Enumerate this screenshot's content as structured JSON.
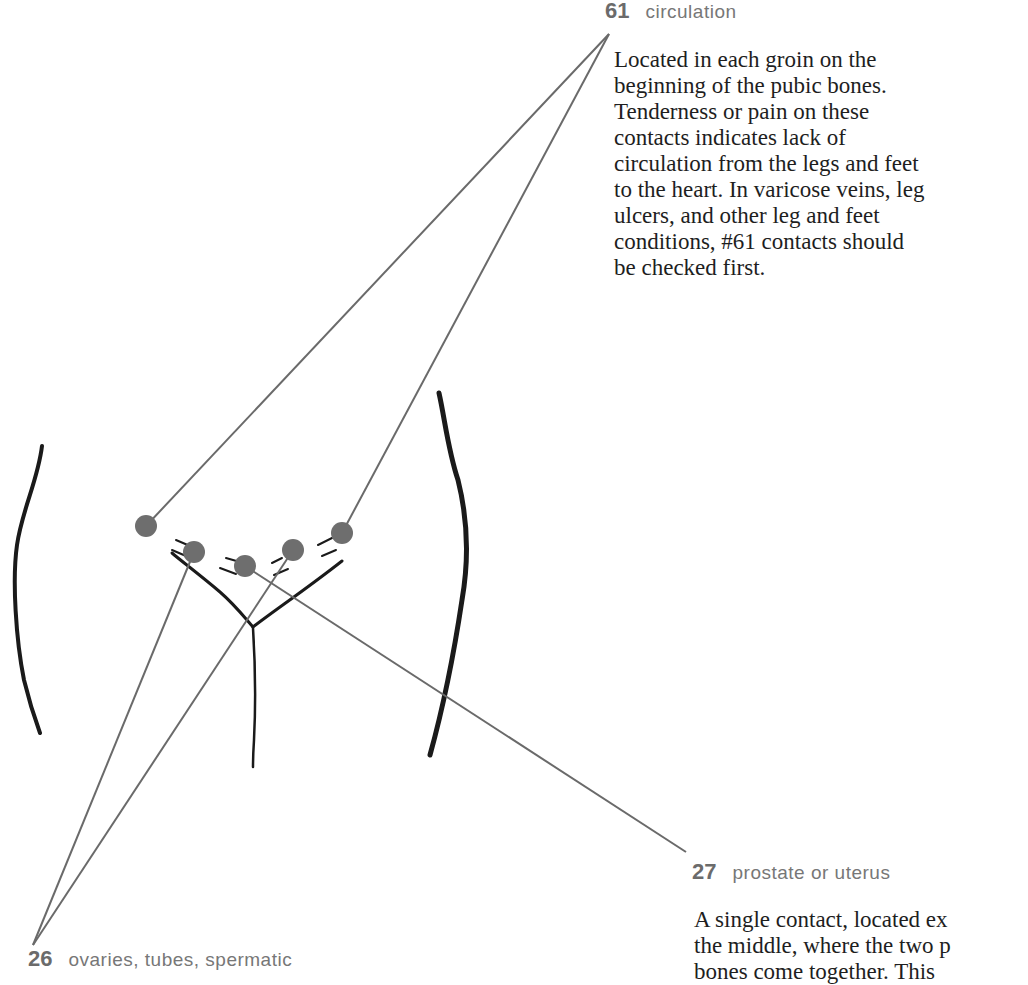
{
  "points": {
    "p61": {
      "number": "61",
      "name": "circulation",
      "description": [
        "Located in each groin on the",
        "beginning of the pubic bones.",
        "Tenderness or pain on these",
        "contacts indicates lack of",
        "circulation from the legs and feet",
        "to the heart. In varicose veins, leg",
        "ulcers, and other leg and feet",
        "conditions, #61 contacts should",
        "be checked first."
      ]
    },
    "p27": {
      "number": "27",
      "name": "prostate or uterus",
      "description": [
        "A single contact, located ex",
        "the middle, where the two p",
        "bones come together. This"
      ]
    },
    "p26": {
      "number": "26",
      "name": "ovaries, tubes, spermatic"
    }
  },
  "colors": {
    "contact_dot": "#6e6e6e",
    "leader_line": "#6a6a6a",
    "outline": "#1a1a1a"
  }
}
